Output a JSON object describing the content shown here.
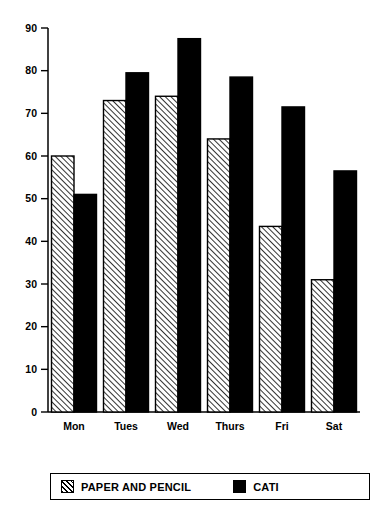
{
  "chart_data": {
    "type": "bar",
    "title": "",
    "subtitle": "",
    "xlabel": "",
    "ylabel": "",
    "categories": [
      "Mon",
      "Tues",
      "Wed",
      "Thurs",
      "Fri",
      "Sat"
    ],
    "series": [
      {
        "name": "PAPER AND PENCIL",
        "fill": "hatch-diagonal",
        "color": "#000000",
        "values": [
          60,
          73,
          74,
          64,
          43.5,
          31
        ]
      },
      {
        "name": "CATI",
        "fill": "solid",
        "color": "#000000",
        "values": [
          51,
          79.5,
          87.5,
          78.5,
          71.5,
          56.5
        ]
      }
    ],
    "ylim": [
      0,
      90
    ],
    "yticks": [
      0,
      10,
      20,
      30,
      40,
      50,
      60,
      70,
      80,
      90
    ],
    "ytick_labels": [
      "0",
      "10",
      "20",
      "30",
      "40",
      "50",
      "60",
      "70",
      "80",
      "90"
    ],
    "grid": false,
    "legend_position": "bottom",
    "axis_color": "#000000",
    "background": "#ffffff"
  },
  "legend": {
    "entries": [
      {
        "label": "PAPER AND PENCIL",
        "swatch": "hatch"
      },
      {
        "label": "CATI",
        "swatch": "solid"
      }
    ]
  }
}
